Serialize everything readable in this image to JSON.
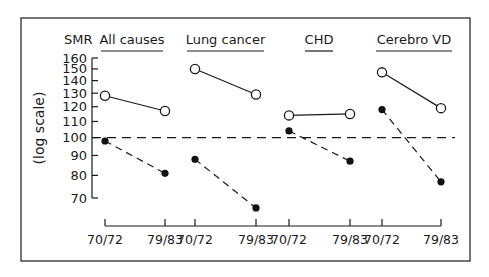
{
  "chart_data": {
    "type": "line",
    "title": "",
    "ylabel": "SMR",
    "ylabel_rotated": "(log scale)",
    "yscale": "log",
    "ylim": [
      65,
      160
    ],
    "yticks": [
      70,
      80,
      90,
      100,
      110,
      120,
      130,
      140,
      150,
      160
    ],
    "reference_line": {
      "y": 100,
      "style": "dashed"
    },
    "grid": false,
    "legend": null,
    "panels": [
      {
        "name": "All causes",
        "x": [
          "70/72",
          "79/83"
        ],
        "series": [
          {
            "name": "open-circle",
            "style": "solid",
            "values": [
              128,
              117
            ]
          },
          {
            "name": "filled-circle",
            "style": "dashed",
            "values": [
              98,
              81
            ]
          }
        ]
      },
      {
        "name": "Lung cancer",
        "x": [
          "70/72",
          "79/83"
        ],
        "series": [
          {
            "name": "open-circle",
            "style": "solid",
            "values": [
              150,
              129
            ]
          },
          {
            "name": "filled-circle",
            "style": "dashed",
            "values": [
              88,
              66
            ]
          }
        ]
      },
      {
        "name": "CHD",
        "x": [
          "70/72",
          "79/83"
        ],
        "series": [
          {
            "name": "open-circle",
            "style": "solid",
            "values": [
              114,
              115
            ]
          },
          {
            "name": "filled-circle",
            "style": "dashed",
            "values": [
              104,
              87
            ]
          }
        ]
      },
      {
        "name": "Cerebro VD",
        "x": [
          "70/72",
          "79/83"
        ],
        "series": [
          {
            "name": "open-circle",
            "style": "solid",
            "values": [
              147,
              119
            ]
          },
          {
            "name": "filled-circle",
            "style": "dashed",
            "values": [
              118,
              77
            ]
          }
        ]
      }
    ]
  },
  "labels": {
    "smr": "SMR",
    "log_scale": "(log scale)",
    "panels": [
      "All causes",
      "Lung cancer",
      "CHD",
      "Cerebro VD"
    ],
    "period_a": "70/72",
    "period_b": "79/83"
  }
}
